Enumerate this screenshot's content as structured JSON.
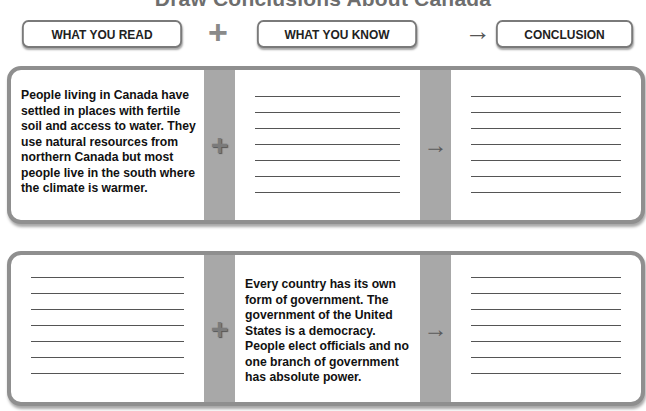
{
  "title": "Draw Conclusions About Canada",
  "headers": {
    "read": "WHAT YOU READ",
    "know": "WHAT YOU KNOW",
    "conclusion": "CONCLUSION",
    "plus_symbol": "+",
    "arrow_symbol": "→"
  },
  "rows": [
    {
      "read": "People living in Canada have settled in places with fertile soil and access to water. They use natural resources from northern Canada but most people live in the south where the climate is warmer.",
      "know": "",
      "conclusion": "",
      "plus_symbol": "+",
      "arrow_symbol": "→"
    },
    {
      "read": "",
      "know": "Every country has its own form of government. The government of the United States is a democracy. People elect officials and no one branch of government has absolute power.",
      "conclusion": "",
      "plus_symbol": "+",
      "arrow_symbol": "→"
    }
  ],
  "colors": {
    "border": "#8f8f8f",
    "band": "#a8a8a8",
    "text": "#111111"
  }
}
